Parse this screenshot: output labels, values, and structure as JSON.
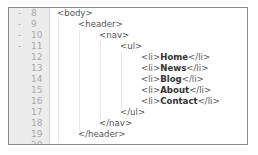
{
  "editor": {
    "lines": [
      {
        "num": "8",
        "fold": "-",
        "indent": 0,
        "pre": "<body>",
        "content": "",
        "post": ""
      },
      {
        "num": "9",
        "fold": "-",
        "indent": 1,
        "pre": "<header>",
        "content": "",
        "post": ""
      },
      {
        "num": "10",
        "fold": "-",
        "indent": 2,
        "pre": "<nav>",
        "content": "",
        "post": ""
      },
      {
        "num": "11",
        "fold": "-",
        "indent": 3,
        "pre": "<ul>",
        "content": "",
        "post": ""
      },
      {
        "num": "12",
        "fold": "",
        "indent": 4,
        "pre": "<li>",
        "content": "Home",
        "post": "</li>"
      },
      {
        "num": "13",
        "fold": "",
        "indent": 4,
        "pre": "<li>",
        "content": "News",
        "post": "</li>"
      },
      {
        "num": "14",
        "fold": "",
        "indent": 4,
        "pre": "<li>",
        "content": "Blog",
        "post": "</li>"
      },
      {
        "num": "15",
        "fold": "",
        "indent": 4,
        "pre": "<li>",
        "content": "About",
        "post": "</li>"
      },
      {
        "num": "16",
        "fold": "",
        "indent": 4,
        "pre": "<li>",
        "content": "Contact",
        "post": "</li>"
      },
      {
        "num": "17",
        "fold": "",
        "indent": 3,
        "pre": "</ul>",
        "content": "",
        "post": ""
      },
      {
        "num": "18",
        "fold": "",
        "indent": 2,
        "pre": "</nav>",
        "content": "",
        "post": ""
      },
      {
        "num": "19",
        "fold": "",
        "indent": 1,
        "pre": "</header>",
        "content": "",
        "post": ""
      },
      {
        "num": "20",
        "fold": "",
        "indent": 0,
        "pre": "",
        "content": "",
        "post": ""
      }
    ]
  },
  "colors": {
    "gutter_bg": "#ececec",
    "line_number": "#a9a9a9",
    "frame_border": "#8a8a8a",
    "code_text": "#444444"
  }
}
